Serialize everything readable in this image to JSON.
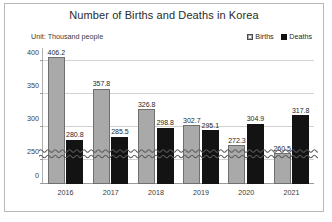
{
  "chart": {
    "title": "Number of Births and Deaths in Korea",
    "unit_note": "Unit: Thousand people",
    "legend": [
      {
        "label": "Births",
        "swatch": "births-swatch",
        "color": "#a9a9a9"
      },
      {
        "label": "Deaths",
        "swatch": "deaths-swatch",
        "color": "#131313"
      }
    ]
  },
  "chart_data": {
    "type": "bar",
    "title": "Number of Births and Deaths in Korea",
    "subtitle": "Unit: Thousand people",
    "xlabel": "",
    "ylabel": "",
    "categories": [
      "2016",
      "2017",
      "2018",
      "2019",
      "2020",
      "2021"
    ],
    "series": [
      {
        "name": "Births",
        "color": "#a9a9a9",
        "values": [
          406.2,
          357.8,
          326.8,
          302.7,
          272.3,
          260.5
        ]
      },
      {
        "name": "Deaths",
        "color": "#131313",
        "values": [
          280.8,
          285.5,
          298.8,
          295.1,
          304.9,
          317.8
        ]
      }
    ],
    "yticks": [
      0,
      250,
      300,
      350,
      400
    ],
    "ytick_labels": [
      "0",
      "250",
      "300",
      "350",
      "400"
    ],
    "ylim": [
      250,
      420
    ],
    "axis_break": {
      "present": true,
      "style": "wavy",
      "between": [
        0,
        250
      ]
    },
    "grid": true,
    "legend_position": "top-right",
    "data_labels": [
      {
        "category": "2016",
        "births": "406.2",
        "deaths": "280.8"
      },
      {
        "category": "2017",
        "births": "357.8",
        "deaths": "285.5"
      },
      {
        "category": "2018",
        "births": "326.8",
        "deaths": "298.8"
      },
      {
        "category": "2019",
        "births": "302.7",
        "deaths": "295.1"
      },
      {
        "category": "2020",
        "births": "272.3",
        "deaths": "304.9"
      },
      {
        "category": "2021",
        "births": "260.5",
        "deaths": "317.8"
      }
    ]
  }
}
